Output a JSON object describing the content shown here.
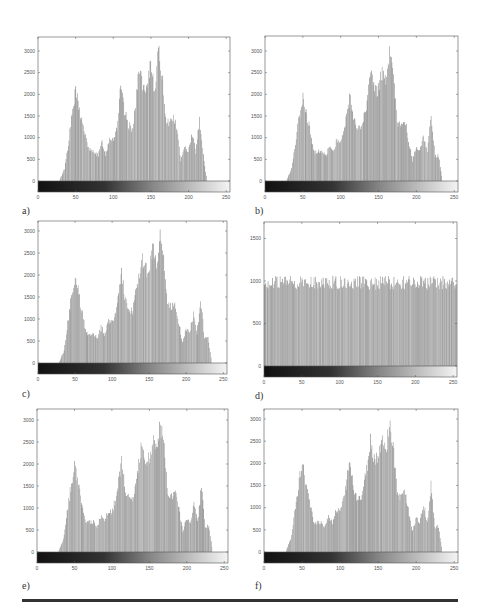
{
  "figure": {
    "labels": [
      "a)",
      "b)",
      "c)",
      "d)",
      "e)",
      "f)"
    ],
    "colors": {
      "bar": "#8a8a8a",
      "axis": "#555555",
      "rule": "#333333"
    }
  },
  "chart_data": [
    {
      "id": "a",
      "type": "bar",
      "title": "",
      "xlabel": "",
      "ylabel": "",
      "xlim": [
        0,
        255
      ],
      "ylim": [
        0,
        3200
      ],
      "xticks": [
        0,
        50,
        100,
        150,
        200,
        250
      ],
      "yticks": [
        0,
        500,
        1000,
        1500,
        2000,
        2500,
        3000
      ],
      "colorbar": "grayscale 0-255 below axis",
      "envelope": [
        [
          0,
          0
        ],
        [
          28,
          0
        ],
        [
          35,
          300
        ],
        [
          40,
          900
        ],
        [
          45,
          1600
        ],
        [
          50,
          2150
        ],
        [
          55,
          1700
        ],
        [
          60,
          1300
        ],
        [
          65,
          900
        ],
        [
          70,
          700
        ],
        [
          75,
          720
        ],
        [
          80,
          600
        ],
        [
          85,
          950
        ],
        [
          90,
          620
        ],
        [
          95,
          1050
        ],
        [
          100,
          1000
        ],
        [
          105,
          1300
        ],
        [
          110,
          2250
        ],
        [
          115,
          1650
        ],
        [
          120,
          1350
        ],
        [
          125,
          1250
        ],
        [
          130,
          1850
        ],
        [
          135,
          2800
        ],
        [
          140,
          2150
        ],
        [
          145,
          2150
        ],
        [
          150,
          2900
        ],
        [
          155,
          2200
        ],
        [
          160,
          3100
        ],
        [
          165,
          2600
        ],
        [
          170,
          1500
        ],
        [
          175,
          1400
        ],
        [
          180,
          1550
        ],
        [
          185,
          1250
        ],
        [
          190,
          500
        ],
        [
          195,
          780
        ],
        [
          200,
          750
        ],
        [
          205,
          1150
        ],
        [
          210,
          700
        ],
        [
          215,
          1500
        ],
        [
          220,
          600
        ],
        [
          225,
          0
        ],
        [
          255,
          0
        ]
      ]
    },
    {
      "id": "b",
      "type": "bar",
      "title": "",
      "xlabel": "",
      "ylabel": "",
      "xlim": [
        0,
        255
      ],
      "ylim": [
        0,
        3200
      ],
      "xticks": [
        0,
        50,
        100,
        150,
        200,
        250
      ],
      "yticks": [
        0,
        500,
        1000,
        1500,
        2000,
        2500,
        3000
      ],
      "colorbar": "grayscale 0-255 below axis",
      "envelope": [
        [
          0,
          0
        ],
        [
          28,
          0
        ],
        [
          35,
          300
        ],
        [
          42,
          1200
        ],
        [
          50,
          2100
        ],
        [
          55,
          1600
        ],
        [
          60,
          1150
        ],
        [
          65,
          700
        ],
        [
          75,
          700
        ],
        [
          80,
          600
        ],
        [
          85,
          850
        ],
        [
          90,
          700
        ],
        [
          95,
          1000
        ],
        [
          100,
          950
        ],
        [
          105,
          1250
        ],
        [
          113,
          2100
        ],
        [
          118,
          1450
        ],
        [
          122,
          1300
        ],
        [
          128,
          1250
        ],
        [
          135,
          1900
        ],
        [
          140,
          2600
        ],
        [
          145,
          2200
        ],
        [
          150,
          2200
        ],
        [
          155,
          2700
        ],
        [
          160,
          2300
        ],
        [
          165,
          3000
        ],
        [
          170,
          2500
        ],
        [
          175,
          1400
        ],
        [
          180,
          1300
        ],
        [
          185,
          1450
        ],
        [
          190,
          1000
        ],
        [
          195,
          500
        ],
        [
          200,
          780
        ],
        [
          205,
          700
        ],
        [
          210,
          1100
        ],
        [
          215,
          700
        ],
        [
          220,
          1550
        ],
        [
          225,
          600
        ],
        [
          230,
          600
        ],
        [
          235,
          0
        ],
        [
          255,
          0
        ]
      ]
    },
    {
      "id": "c",
      "type": "bar",
      "title": "",
      "xlabel": "",
      "ylabel": "",
      "xlim": [
        0,
        255
      ],
      "ylim": [
        0,
        3200
      ],
      "xticks": [
        0,
        50,
        100,
        150,
        200,
        250
      ],
      "yticks": [
        0,
        500,
        1000,
        1500,
        2000,
        2500,
        3000
      ],
      "colorbar": "grayscale 0-255 below axis",
      "envelope": [
        [
          0,
          0
        ],
        [
          28,
          0
        ],
        [
          35,
          300
        ],
        [
          42,
          1200
        ],
        [
          50,
          2100
        ],
        [
          55,
          1600
        ],
        [
          60,
          1150
        ],
        [
          65,
          700
        ],
        [
          75,
          700
        ],
        [
          80,
          600
        ],
        [
          85,
          850
        ],
        [
          90,
          700
        ],
        [
          95,
          1000
        ],
        [
          100,
          950
        ],
        [
          105,
          1250
        ],
        [
          113,
          2100
        ],
        [
          118,
          1450
        ],
        [
          122,
          1300
        ],
        [
          128,
          1250
        ],
        [
          135,
          1900
        ],
        [
          140,
          2600
        ],
        [
          145,
          2200
        ],
        [
          150,
          2200
        ],
        [
          155,
          2700
        ],
        [
          160,
          2300
        ],
        [
          165,
          3000
        ],
        [
          170,
          2500
        ],
        [
          175,
          1400
        ],
        [
          180,
          1300
        ],
        [
          185,
          1450
        ],
        [
          190,
          1000
        ],
        [
          195,
          500
        ],
        [
          200,
          780
        ],
        [
          205,
          700
        ],
        [
          210,
          1150
        ],
        [
          215,
          700
        ],
        [
          220,
          1550
        ],
        [
          225,
          600
        ],
        [
          230,
          600
        ],
        [
          235,
          0
        ],
        [
          255,
          0
        ]
      ]
    },
    {
      "id": "d",
      "type": "bar",
      "title": "",
      "xlabel": "",
      "ylabel": "",
      "xlim": [
        0,
        255
      ],
      "ylim": [
        0,
        2600
      ],
      "xticks": [
        0,
        50,
        100,
        150,
        200,
        250
      ],
      "yticks": [
        0,
        500,
        1000,
        1500,
        2000,
        2500
      ],
      "colorbar": "grayscale 0-255 below axis",
      "envelope": [
        [
          0,
          1020
        ],
        [
          255,
          1020
        ]
      ],
      "note": "approximately uniform (equalized) histogram ~1000 per bin"
    },
    {
      "id": "e",
      "type": "bar",
      "title": "",
      "xlabel": "",
      "ylabel": "",
      "xlim": [
        0,
        255
      ],
      "ylim": [
        0,
        3200
      ],
      "xticks": [
        0,
        50,
        100,
        150,
        200,
        250
      ],
      "yticks": [
        0,
        500,
        1000,
        1500,
        2000,
        2500,
        3000
      ],
      "colorbar": "grayscale 0-255 below axis",
      "envelope": [
        [
          0,
          0
        ],
        [
          28,
          0
        ],
        [
          35,
          300
        ],
        [
          42,
          1200
        ],
        [
          50,
          2100
        ],
        [
          55,
          1600
        ],
        [
          60,
          1150
        ],
        [
          65,
          700
        ],
        [
          75,
          700
        ],
        [
          80,
          600
        ],
        [
          85,
          850
        ],
        [
          90,
          700
        ],
        [
          95,
          1000
        ],
        [
          100,
          950
        ],
        [
          105,
          1250
        ],
        [
          113,
          2100
        ],
        [
          118,
          1450
        ],
        [
          122,
          1300
        ],
        [
          128,
          1250
        ],
        [
          135,
          1900
        ],
        [
          140,
          2600
        ],
        [
          145,
          2200
        ],
        [
          150,
          2200
        ],
        [
          155,
          2700
        ],
        [
          160,
          2300
        ],
        [
          165,
          3000
        ],
        [
          170,
          2500
        ],
        [
          175,
          1400
        ],
        [
          180,
          1300
        ],
        [
          185,
          1450
        ],
        [
          190,
          1000
        ],
        [
          195,
          500
        ],
        [
          200,
          780
        ],
        [
          205,
          700
        ],
        [
          210,
          1150
        ],
        [
          215,
          700
        ],
        [
          220,
          1550
        ],
        [
          225,
          600
        ],
        [
          230,
          600
        ],
        [
          235,
          0
        ],
        [
          255,
          0
        ]
      ]
    },
    {
      "id": "f",
      "type": "bar",
      "title": "",
      "xlabel": "",
      "ylabel": "",
      "xlim": [
        0,
        255
      ],
      "ylim": [
        0,
        3200
      ],
      "xticks": [
        0,
        50,
        100,
        150,
        200,
        250
      ],
      "yticks": [
        0,
        500,
        1000,
        1500,
        2000,
        2500,
        3000
      ],
      "colorbar": "grayscale 0-255 below axis",
      "envelope": [
        [
          0,
          0
        ],
        [
          28,
          0
        ],
        [
          35,
          300
        ],
        [
          42,
          1200
        ],
        [
          50,
          2100
        ],
        [
          55,
          1600
        ],
        [
          60,
          1150
        ],
        [
          65,
          700
        ],
        [
          75,
          700
        ],
        [
          80,
          600
        ],
        [
          85,
          850
        ],
        [
          90,
          700
        ],
        [
          95,
          1000
        ],
        [
          100,
          950
        ],
        [
          105,
          1250
        ],
        [
          113,
          2100
        ],
        [
          118,
          1450
        ],
        [
          122,
          1300
        ],
        [
          128,
          1250
        ],
        [
          135,
          1900
        ],
        [
          140,
          2600
        ],
        [
          145,
          2200
        ],
        [
          150,
          2200
        ],
        [
          155,
          2700
        ],
        [
          160,
          2300
        ],
        [
          165,
          3000
        ],
        [
          170,
          2500
        ],
        [
          175,
          1400
        ],
        [
          180,
          1300
        ],
        [
          185,
          1450
        ],
        [
          190,
          1000
        ],
        [
          195,
          500
        ],
        [
          200,
          780
        ],
        [
          205,
          700
        ],
        [
          210,
          1150
        ],
        [
          215,
          700
        ],
        [
          220,
          1550
        ],
        [
          225,
          600
        ],
        [
          230,
          600
        ],
        [
          235,
          0
        ],
        [
          255,
          0
        ]
      ]
    }
  ],
  "layout": {
    "panels": [
      {
        "left": 38,
        "top": 37,
        "width": 192,
        "zeroY": 181,
        "y3000": 51
      },
      {
        "left": 265,
        "top": 36,
        "width": 193,
        "zeroY": 181,
        "y3000": 51
      },
      {
        "left": 38,
        "top": 221,
        "width": 189,
        "zeroY": 363,
        "y3000": 231
      },
      {
        "left": 264,
        "top": 222,
        "width": 193,
        "zeroY": 366,
        "y3000": 281
      },
      {
        "left": 37,
        "top": 409,
        "width": 191,
        "zeroY": 552,
        "y3000": 420
      },
      {
        "left": 264,
        "top": 409,
        "width": 194,
        "zeroY": 552,
        "y3000": 419
      }
    ],
    "labelPos": [
      [
        22,
        205
      ],
      [
        255,
        205
      ],
      [
        22,
        388
      ],
      [
        255,
        390
      ],
      [
        22,
        580
      ],
      [
        255,
        580
      ]
    ]
  }
}
